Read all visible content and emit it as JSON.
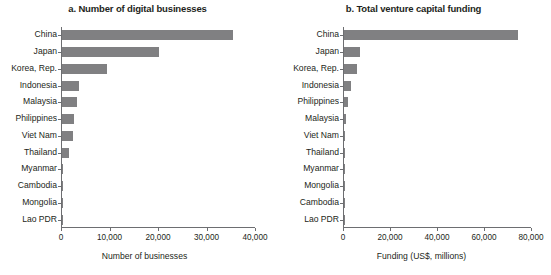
{
  "figure": {
    "background": "#ffffff",
    "bar_color": "#808082",
    "axis_color": "#6d6e71",
    "text_color": "#231f20"
  },
  "chart_data": [
    {
      "type": "bar",
      "orientation": "horizontal",
      "panel": "a",
      "title": "a. Number of digital businesses",
      "xlabel": "Number of businesses",
      "ylabel": "",
      "xlim": [
        0,
        40000
      ],
      "xticks": [
        0,
        10000,
        20000,
        30000,
        40000
      ],
      "xtick_labels": [
        "0",
        "10,000",
        "20,000",
        "30,000",
        "40,000"
      ],
      "grid": false,
      "legend": "none",
      "categories": [
        "China",
        "Japan",
        "Korea, Rep.",
        "Indonesia",
        "Malaysia",
        "Philippines",
        "Viet Nam",
        "Thailand",
        "Myanmar",
        "Cambodia",
        "Mongolia",
        "Lao PDR"
      ],
      "values": [
        35300,
        20000,
        9300,
        3500,
        3100,
        2400,
        2300,
        1500,
        180,
        120,
        90,
        60
      ]
    },
    {
      "type": "bar",
      "orientation": "horizontal",
      "panel": "b",
      "title": "b. Total venture capital funding",
      "xlabel": "Funding (US$, millions)",
      "ylabel": "",
      "xlim": [
        0,
        80000
      ],
      "xticks": [
        0,
        20000,
        40000,
        60000,
        80000
      ],
      "xtick_labels": [
        "0",
        "20,000",
        "40,000",
        "60,000",
        "80,000"
      ],
      "grid": false,
      "legend": "none",
      "categories": [
        "China",
        "Japan",
        "Korea, Rep.",
        "Indonesia",
        "Philippines",
        "Malaysia",
        "Viet Nam",
        "Thailand",
        "Myanmar",
        "Mongolia",
        "Cambodia",
        "Lao PDR"
      ],
      "values": [
        74000,
        6800,
        5500,
        3000,
        1700,
        900,
        500,
        300,
        60,
        40,
        30,
        20
      ]
    }
  ]
}
